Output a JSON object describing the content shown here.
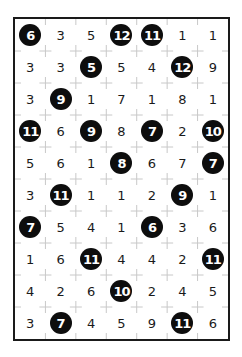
{
  "puzzle": {
    "type": "hitori-style number grid",
    "columns": 7,
    "rows": 10,
    "grid": [
      [
        6,
        3,
        5,
        12,
        11,
        1,
        1
      ],
      [
        3,
        3,
        5,
        5,
        4,
        12,
        9
      ],
      [
        3,
        9,
        1,
        7,
        1,
        8,
        1
      ],
      [
        11,
        6,
        9,
        8,
        7,
        2,
        10
      ],
      [
        5,
        6,
        1,
        8,
        6,
        7,
        7
      ],
      [
        3,
        11,
        1,
        1,
        2,
        9,
        1
      ],
      [
        7,
        5,
        4,
        1,
        6,
        3,
        6
      ],
      [
        1,
        6,
        11,
        4,
        4,
        2,
        11
      ],
      [
        4,
        2,
        6,
        10,
        2,
        4,
        5
      ],
      [
        3,
        7,
        4,
        5,
        9,
        11,
        6
      ]
    ],
    "shaded": [
      [
        true,
        false,
        false,
        true,
        true,
        false,
        false
      ],
      [
        false,
        false,
        true,
        false,
        false,
        true,
        false
      ],
      [
        false,
        true,
        false,
        false,
        false,
        false,
        false
      ],
      [
        true,
        false,
        true,
        false,
        true,
        false,
        true
      ],
      [
        false,
        false,
        false,
        true,
        false,
        false,
        true
      ],
      [
        false,
        true,
        false,
        false,
        false,
        true,
        false
      ],
      [
        true,
        false,
        false,
        false,
        true,
        false,
        false
      ],
      [
        false,
        false,
        true,
        false,
        false,
        false,
        true
      ],
      [
        false,
        false,
        false,
        true,
        false,
        false,
        false
      ],
      [
        false,
        true,
        false,
        false,
        false,
        true,
        false
      ]
    ],
    "colors": {
      "border": "#1a1a1a",
      "circle_fill": "#0d0d0d",
      "circle_text": "#ffffff",
      "number_text": "#1a1a1a",
      "cross_marks": "#c8c8c8"
    }
  }
}
